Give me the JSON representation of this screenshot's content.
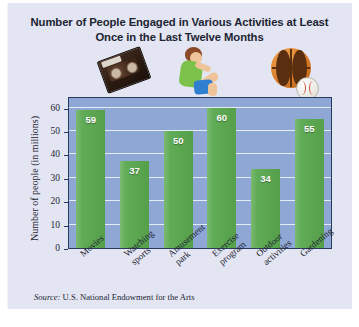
{
  "figure": {
    "title": "Number of People Engaged in Various Activities at Least Once in the Last Twelve Months",
    "source_prefix": "Source:",
    "source_text": "U.S. National Endowment for the Arts",
    "background_color": "#e3e6f2",
    "plot_background_color": "#8fa7d4",
    "bar_color": "#5aa84f",
    "border_color": "#2a3a5c",
    "text_color": "#1d2433"
  },
  "decorations": [
    {
      "name": "vhs-cassette-clipart",
      "label": "VHS videotape"
    },
    {
      "name": "person-doing-situps-clipart",
      "label": "Person doing sit-ups"
    },
    {
      "name": "basketball-and-baseball-clipart",
      "label": "Basketball and baseball"
    }
  ],
  "chart_data": {
    "type": "bar",
    "title": "Number of People Engaged in Various Activities at Least Once in the Last Twelve Months",
    "xlabel": "",
    "ylabel": "Number of people (in millions)",
    "categories": [
      "Movies",
      "Watching sports",
      "Amusement park",
      "Exercise program",
      "Outdoor activities",
      "Gardening"
    ],
    "category_lines": [
      [
        "Movies"
      ],
      [
        "Watching",
        "sports"
      ],
      [
        "Amusement",
        "park"
      ],
      [
        "Exercise",
        "program"
      ],
      [
        "Outdoor",
        "activities"
      ],
      [
        "Gardening"
      ]
    ],
    "values": [
      59,
      37,
      50,
      60,
      34,
      55
    ],
    "data_labels": [
      "59",
      "37",
      "50",
      "60",
      "34",
      "55"
    ],
    "ylim": [
      0,
      65
    ],
    "yticks": [
      0,
      10,
      20,
      30,
      40,
      50,
      60
    ],
    "ytick_labels": [
      "0",
      "10",
      "20",
      "30",
      "40",
      "50",
      "60"
    ],
    "grid": true,
    "grid_axis": "y",
    "legend": false,
    "series": [
      {
        "name": "People (millions)",
        "values": [
          59,
          37,
          50,
          60,
          34,
          55
        ]
      }
    ]
  }
}
